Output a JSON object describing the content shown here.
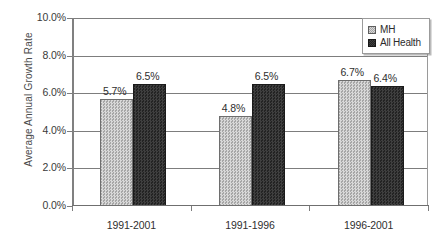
{
  "chart_data": {
    "type": "bar",
    "title": "",
    "xlabel": "",
    "ylabel": "Average Annual Growth Rate",
    "categories": [
      "1991-2001",
      "1991-1996",
      "1996-2001"
    ],
    "series": [
      {
        "name": "MH",
        "color": "#bdbdbd",
        "values": [
          5.7,
          4.8,
          6.7
        ],
        "labels": [
          "5.7%",
          "4.8%",
          "6.7%"
        ]
      },
      {
        "name": "All Health",
        "color": "#2e2e2e",
        "values": [
          6.5,
          6.5,
          6.4
        ],
        "labels": [
          "6.5%",
          "6.5%",
          "6.4%"
        ]
      }
    ],
    "ylim": [
      0,
      10
    ],
    "ytick_values": [
      0,
      2,
      4,
      6,
      8,
      10
    ],
    "ytick_labels": [
      "0.0%",
      "2.0%",
      "4.0%",
      "6.0%",
      "8.0%",
      "10.0%"
    ],
    "grid": true,
    "legend_position": "top-right",
    "value_labels_shown": true
  },
  "legend": {
    "entries": [
      {
        "label": "MH",
        "swatch": "legend-swatch-mh"
      },
      {
        "label": "All Health",
        "swatch": "legend-swatch-all-health"
      }
    ]
  }
}
